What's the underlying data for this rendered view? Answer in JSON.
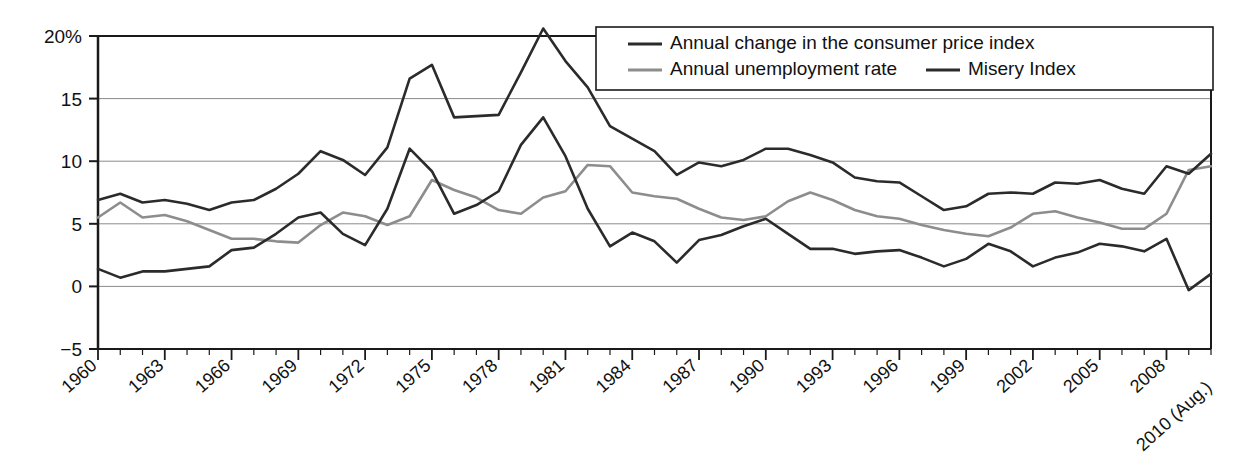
{
  "chart_data": {
    "type": "line",
    "title": "",
    "xlabel": "",
    "ylabel": "",
    "ylim": [
      -5,
      20
    ],
    "yticks": [
      -5,
      0,
      5,
      10,
      15,
      20
    ],
    "ytick_labels": [
      "−5",
      "0",
      "5",
      "10",
      "15",
      "20%"
    ],
    "grid": true,
    "legend_position": "top-right",
    "x": [
      1960,
      1961,
      1962,
      1963,
      1964,
      1965,
      1966,
      1967,
      1968,
      1969,
      1970,
      1971,
      1972,
      1973,
      1974,
      1975,
      1976,
      1977,
      1978,
      1979,
      1980,
      1981,
      1982,
      1983,
      1984,
      1985,
      1986,
      1987,
      1988,
      1989,
      1990,
      1991,
      1992,
      1993,
      1994,
      1995,
      1996,
      1997,
      1998,
      1999,
      2000,
      2001,
      2002,
      2003,
      2004,
      2005,
      2006,
      2007,
      2008,
      2009,
      2010
    ],
    "xtick_labels": [
      "1960",
      "1963",
      "1966",
      "1969",
      "1972",
      "1975",
      "1978",
      "1981",
      "1984",
      "1987",
      "1990",
      "1993",
      "1996",
      "1999",
      "2002",
      "2005",
      "2008",
      "2010 (Aug.)"
    ],
    "xtick_years": [
      1960,
      1963,
      1966,
      1969,
      1972,
      1975,
      1978,
      1981,
      1984,
      1987,
      1990,
      1993,
      1996,
      1999,
      2002,
      2005,
      2008,
      2010
    ],
    "xtick_interval_minor": 1,
    "xtick_interval_major": 3,
    "series": [
      {
        "name": "Annual change in the consumer price index",
        "key": "cpi",
        "color": "#2b2b2b",
        "values": [
          1.4,
          0.7,
          1.2,
          1.2,
          1.4,
          1.6,
          2.9,
          3.1,
          4.2,
          5.5,
          5.9,
          4.2,
          3.3,
          6.2,
          11.0,
          9.2,
          5.8,
          6.5,
          7.6,
          11.3,
          13.5,
          10.4,
          6.2,
          3.2,
          4.3,
          3.6,
          1.9,
          3.7,
          4.1,
          4.8,
          5.4,
          4.2,
          3.0,
          3.0,
          2.6,
          2.8,
          2.9,
          2.3,
          1.6,
          2.2,
          3.4,
          2.8,
          1.6,
          2.3,
          2.7,
          3.4,
          3.2,
          2.8,
          3.8,
          -0.3,
          1.0
        ]
      },
      {
        "name": "Annual unemployment rate",
        "key": "unemployment",
        "color": "#8d8d8d",
        "values": [
          5.5,
          6.7,
          5.5,
          5.7,
          5.2,
          4.5,
          3.8,
          3.8,
          3.6,
          3.5,
          4.9,
          5.9,
          5.6,
          4.9,
          5.6,
          8.5,
          7.7,
          7.1,
          6.1,
          5.8,
          7.1,
          7.6,
          9.7,
          9.6,
          7.5,
          7.2,
          7.0,
          6.2,
          5.5,
          5.3,
          5.6,
          6.8,
          7.5,
          6.9,
          6.1,
          5.6,
          5.4,
          4.9,
          4.5,
          4.2,
          4.0,
          4.7,
          5.8,
          6.0,
          5.5,
          5.1,
          4.6,
          4.6,
          5.8,
          9.3,
          9.6
        ]
      },
      {
        "name": "Misery Index",
        "key": "misery",
        "color": "#2b2b2b",
        "values": [
          6.9,
          7.4,
          6.7,
          6.9,
          6.6,
          6.1,
          6.7,
          6.9,
          7.8,
          9.0,
          10.8,
          10.1,
          8.9,
          11.1,
          16.6,
          17.7,
          13.5,
          13.6,
          13.7,
          17.1,
          20.6,
          18.0,
          15.9,
          12.8,
          11.8,
          10.8,
          8.9,
          9.9,
          9.6,
          10.1,
          11.0,
          11.0,
          10.5,
          9.9,
          8.7,
          8.4,
          8.3,
          7.2,
          6.1,
          6.4,
          7.4,
          7.5,
          7.4,
          8.3,
          8.2,
          8.5,
          7.8,
          7.4,
          9.6,
          9.0,
          10.6
        ]
      }
    ],
    "plot_area": {
      "left": 98,
      "right": 1211,
      "top": 36,
      "bottom": 349
    }
  },
  "legend": {
    "items": [
      {
        "label": "Annual change in the consumer price index",
        "swatch_color": "#2b2b2b"
      },
      {
        "label": "Annual unemployment rate",
        "swatch_color": "#8d8d8d"
      },
      {
        "label": "Misery Index",
        "swatch_color": "#2b2b2b"
      }
    ]
  },
  "colors": {
    "axis": "#1a1a1a",
    "grid": "#8a8a8a",
    "background": "#ffffff",
    "dark_line": "#2b2b2b",
    "gray_line": "#8d8d8d"
  }
}
